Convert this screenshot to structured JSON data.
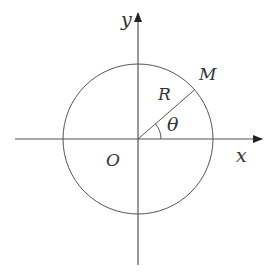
{
  "diagram": {
    "type": "polar-coordinate-circle",
    "colors": {
      "background": "#ffffff",
      "stroke": "#555555",
      "text": "#333333"
    },
    "axes": {
      "x_label": "x",
      "y_label": "y"
    },
    "origin_label": "O",
    "radius_label": "R",
    "point_label": "M",
    "angle_label": "θ",
    "circle": {
      "cx": 138,
      "cy": 139,
      "r": 75
    },
    "angle_deg": 41
  }
}
